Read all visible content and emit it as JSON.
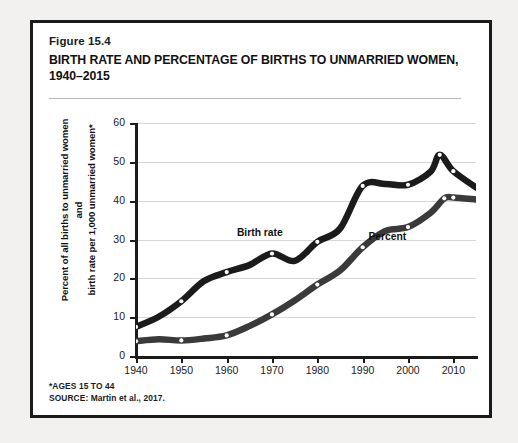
{
  "figure": {
    "number": "Figure 15.4",
    "title": "BIRTH RATE AND PERCENTAGE OF BIRTHS TO UNMARRIED WOMEN, 1940–2015",
    "footnote": "*AGES 15 TO 44",
    "source": "SOURCE: Martin et al., 2017."
  },
  "colors": {
    "frame": "#1b1b1b",
    "background": "#ffffff",
    "page": "#f2f1ef",
    "grid": "#d7d7d7",
    "series_birth_rate": "#1b1b1b",
    "series_percent": "#3a3a3a",
    "marker_fill": "#ffffff"
  },
  "chart_data": {
    "type": "line",
    "title": "BIRTH RATE AND PERCENTAGE OF BIRTHS TO UNMARRIED WOMEN, 1940–2015",
    "xlabel": "",
    "ylabel": "Percent of all births to unmarried women and birth rate per 1,000 unmarried women*",
    "ylabel_lines": [
      "Percent of all births to unmarried women and",
      "birth rate per 1,000 unmarried women*"
    ],
    "xlim": [
      1940,
      2015
    ],
    "ylim": [
      0,
      60
    ],
    "yticks": [
      0,
      10,
      20,
      30,
      40,
      50,
      60
    ],
    "xticks": [
      1940,
      1950,
      1960,
      1970,
      1980,
      1990,
      2000,
      2010
    ],
    "grid": true,
    "legend": "inline-labels",
    "series": [
      {
        "name": "Birth rate",
        "label_x": 1968,
        "label_y": 31.5,
        "x": [
          1940,
          1945,
          1950,
          1955,
          1960,
          1965,
          1970,
          1975,
          1980,
          1985,
          1990,
          1995,
          2000,
          2005,
          2007,
          2010,
          2015
        ],
        "values": [
          7.5,
          10.1,
          14.1,
          19.3,
          21.6,
          23.4,
          26.4,
          24.5,
          29.4,
          32.8,
          43.8,
          44.3,
          44.1,
          47.5,
          51.8,
          47.6,
          43.4
        ],
        "markers_at": [
          1940,
          1950,
          1960,
          1970,
          1980,
          1990,
          2000,
          2007,
          2010
        ]
      },
      {
        "name": "Percent",
        "label_x": 1997,
        "label_y": 30.5,
        "x": [
          1940,
          1945,
          1950,
          1955,
          1960,
          1965,
          1970,
          1975,
          1980,
          1985,
          1990,
          1995,
          2000,
          2005,
          2008,
          2010,
          2015
        ],
        "values": [
          3.8,
          4.3,
          4.0,
          4.5,
          5.3,
          7.7,
          10.7,
          14.3,
          18.4,
          22.0,
          28.0,
          32.2,
          33.2,
          36.9,
          40.6,
          40.8,
          40.3
        ],
        "markers_at": [
          1940,
          1950,
          1960,
          1970,
          1980,
          1990,
          2000,
          2008,
          2010
        ]
      }
    ]
  }
}
